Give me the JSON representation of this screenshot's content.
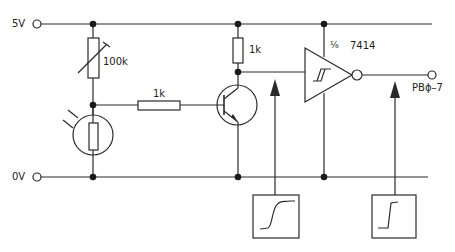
{
  "terminals": {
    "supply": "5V",
    "ground": "0V",
    "output": "PBϕ–7"
  },
  "components": {
    "variable_resistor": "100k",
    "base_resistor": "1k",
    "collector_resistor": "1k",
    "gate_fraction": "⅙",
    "gate_part": "7414"
  },
  "waveforms": {
    "before_gate": "slow-rising-edge",
    "after_gate": "sharp-rising-edge"
  },
  "colors": {
    "line": "#2a2a2a",
    "background": "#ffffff"
  }
}
